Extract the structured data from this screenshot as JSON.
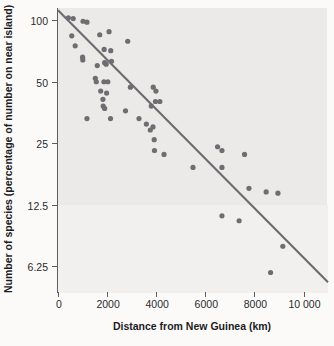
{
  "chart_data": {
    "type": "scatter",
    "title": "",
    "xlabel": "Distance from New Guinea (km)",
    "ylabel": "Number of species (percentage of number on near island)",
    "xlim": [
      0,
      11000
    ],
    "ylim": [
      4.6,
      115
    ],
    "yscale": "log2",
    "grid": false,
    "legend": null,
    "xticks": [
      {
        "value": 0,
        "label": "0"
      },
      {
        "value": 2000,
        "label": "2000"
      },
      {
        "value": 4000,
        "label": "4000"
      },
      {
        "value": 6000,
        "label": "6000"
      },
      {
        "value": 8000,
        "label": "8000"
      },
      {
        "value": 10000,
        "label": "10 000"
      }
    ],
    "yticks": [
      {
        "value": 100,
        "label": "100"
      },
      {
        "value": 50,
        "label": "50"
      },
      {
        "value": 25,
        "label": "25"
      },
      {
        "value": 12.5,
        "label": "12.5"
      },
      {
        "value": 6.25,
        "label": "6.25"
      }
    ],
    "point_color": "#6e6e72",
    "line_color": "#6b6b70",
    "panel_color": "#eceae8",
    "points": [
      {
        "x": 420,
        "y": 103
      },
      {
        "x": 620,
        "y": 102
      },
      {
        "x": 560,
        "y": 84
      },
      {
        "x": 1020,
        "y": 99
      },
      {
        "x": 1180,
        "y": 98
      },
      {
        "x": 700,
        "y": 75
      },
      {
        "x": 1000,
        "y": 66
      },
      {
        "x": 1010,
        "y": 64
      },
      {
        "x": 1700,
        "y": 85
      },
      {
        "x": 2080,
        "y": 88
      },
      {
        "x": 1880,
        "y": 72
      },
      {
        "x": 2150,
        "y": 71
      },
      {
        "x": 2840,
        "y": 79
      },
      {
        "x": 1600,
        "y": 60
      },
      {
        "x": 1900,
        "y": 62
      },
      {
        "x": 1960,
        "y": 61
      },
      {
        "x": 2180,
        "y": 63
      },
      {
        "x": 1520,
        "y": 52
      },
      {
        "x": 1560,
        "y": 50
      },
      {
        "x": 1870,
        "y": 50
      },
      {
        "x": 2030,
        "y": 50
      },
      {
        "x": 1740,
        "y": 45
      },
      {
        "x": 1980,
        "y": 44
      },
      {
        "x": 1830,
        "y": 41
      },
      {
        "x": 1840,
        "y": 38
      },
      {
        "x": 1900,
        "y": 37
      },
      {
        "x": 1180,
        "y": 33
      },
      {
        "x": 2140,
        "y": 33
      },
      {
        "x": 2750,
        "y": 36
      },
      {
        "x": 2950,
        "y": 47
      },
      {
        "x": 3300,
        "y": 33
      },
      {
        "x": 3600,
        "y": 31
      },
      {
        "x": 3800,
        "y": 38
      },
      {
        "x": 3880,
        "y": 47
      },
      {
        "x": 3990,
        "y": 45
      },
      {
        "x": 3870,
        "y": 30
      },
      {
        "x": 3970,
        "y": 40
      },
      {
        "x": 4150,
        "y": 40
      },
      {
        "x": 3760,
        "y": 29
      },
      {
        "x": 3920,
        "y": 26
      },
      {
        "x": 3930,
        "y": 23
      },
      {
        "x": 4320,
        "y": 22
      },
      {
        "x": 5500,
        "y": 19
      },
      {
        "x": 6500,
        "y": 24
      },
      {
        "x": 6680,
        "y": 23
      },
      {
        "x": 6680,
        "y": 19
      },
      {
        "x": 7600,
        "y": 22
      },
      {
        "x": 7780,
        "y": 15
      },
      {
        "x": 8480,
        "y": 14.4
      },
      {
        "x": 8960,
        "y": 14.2
      },
      {
        "x": 6680,
        "y": 11
      },
      {
        "x": 7380,
        "y": 10.4
      },
      {
        "x": 9160,
        "y": 7.8
      },
      {
        "x": 8660,
        "y": 5.8
      }
    ],
    "fit_line": {
      "x1": 0,
      "y1": 112,
      "x2": 11000,
      "y2": 5.2
    }
  }
}
